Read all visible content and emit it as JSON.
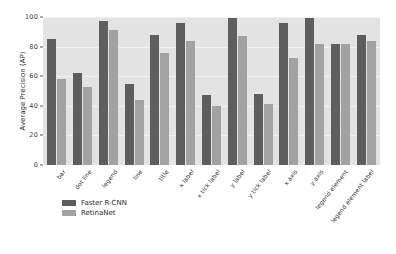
{
  "chart_data": {
    "type": "bar",
    "title": "",
    "xlabel": "",
    "ylabel": "Average Precision (AP)",
    "ylim": [
      0,
      100
    ],
    "yticks": [
      0,
      20,
      40,
      60,
      80,
      100
    ],
    "grid": true,
    "legend_position": "below-axes-left",
    "categories": [
      "bar",
      "dot line",
      "legend",
      "line",
      "title",
      "x label",
      "x tick label",
      "y label",
      "y tick label",
      "x axis",
      "y axis",
      "legend element",
      "legend element label"
    ],
    "series": [
      {
        "name": "Faster R-CNN",
        "color": "#5e5e5e",
        "values": [
          85,
          62,
          97,
          55,
          88,
          96,
          47,
          99,
          48,
          96,
          99,
          82,
          88
        ]
      },
      {
        "name": "RetinaNet",
        "color": "#a2a2a2",
        "values": [
          58,
          53,
          91,
          44,
          76,
          84,
          40,
          87,
          41,
          72,
          82,
          82,
          84
        ]
      }
    ]
  },
  "axes": {
    "y_label": "Average Precision (AP)",
    "y_tick_labels": [
      "0",
      "20",
      "40",
      "60",
      "80",
      "100"
    ]
  },
  "legend": {
    "entries": [
      {
        "label": "Faster R-CNN"
      },
      {
        "label": "RetinaNet"
      }
    ]
  },
  "colors": {
    "series_0": "#5e5e5e",
    "series_1": "#a2a2a2",
    "plot_background": "#e3e3e3",
    "figure_background": "#ffffff",
    "grid": "#f2f2f2"
  }
}
